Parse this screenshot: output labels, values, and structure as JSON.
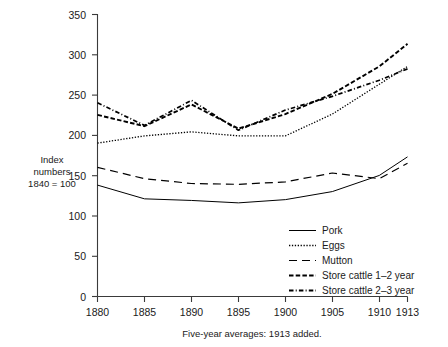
{
  "chart_data": {
    "type": "line",
    "title": "",
    "subtitle": "",
    "xlabel": "Five-year averages: 1913 added.",
    "ylabel": "Index numbers 1840 = 100",
    "ylabel_lines": [
      "Index",
      "numbers",
      "1840 = 100"
    ],
    "x": [
      1880,
      1885,
      1890,
      1895,
      1900,
      1905,
      1910,
      1913
    ],
    "xtick_labels": [
      "1880",
      "1885",
      "1890",
      "1895",
      "1900",
      "1905",
      "1910",
      "1913"
    ],
    "ytick_labels": [
      "0",
      "50",
      "100",
      "150",
      "200",
      "250",
      "300",
      "350"
    ],
    "yticks": [
      0,
      50,
      100,
      150,
      200,
      250,
      300,
      350
    ],
    "xlim": [
      1880,
      1913
    ],
    "ylim": [
      0,
      350
    ],
    "grid": false,
    "legend_position": "inside-bottom-right",
    "series": [
      {
        "name": "Pork",
        "style": "solid",
        "values": [
          138,
          121,
          119,
          116,
          120,
          130,
          150,
          173
        ]
      },
      {
        "name": "Eggs",
        "style": "dotted",
        "values": [
          190,
          199,
          204,
          199,
          199,
          226,
          263,
          285
        ]
      },
      {
        "name": "Mutton",
        "style": "dashed-long",
        "values": [
          160,
          146,
          140,
          139,
          142,
          153,
          146,
          165
        ]
      },
      {
        "name": "Store cattle 1–2 year",
        "style": "dashed-short",
        "values": [
          225,
          211,
          238,
          208,
          226,
          251,
          285,
          313
        ]
      },
      {
        "name": "Store cattle 2–3 year",
        "style": "dash-dot",
        "values": [
          240,
          212,
          243,
          206,
          231,
          248,
          268,
          282
        ]
      }
    ]
  },
  "legend": {
    "items": [
      {
        "label": "Pork",
        "swatch": "solid-line-swatch"
      },
      {
        "label": "Eggs",
        "swatch": "dotted-line-swatch"
      },
      {
        "label": "Mutton",
        "swatch": "long-dash-line-swatch"
      },
      {
        "label": "Store cattle 1–2 year",
        "swatch": "short-dash-line-swatch"
      },
      {
        "label": "Store cattle 2–3 year",
        "swatch": "dash-dot-line-swatch"
      }
    ]
  }
}
